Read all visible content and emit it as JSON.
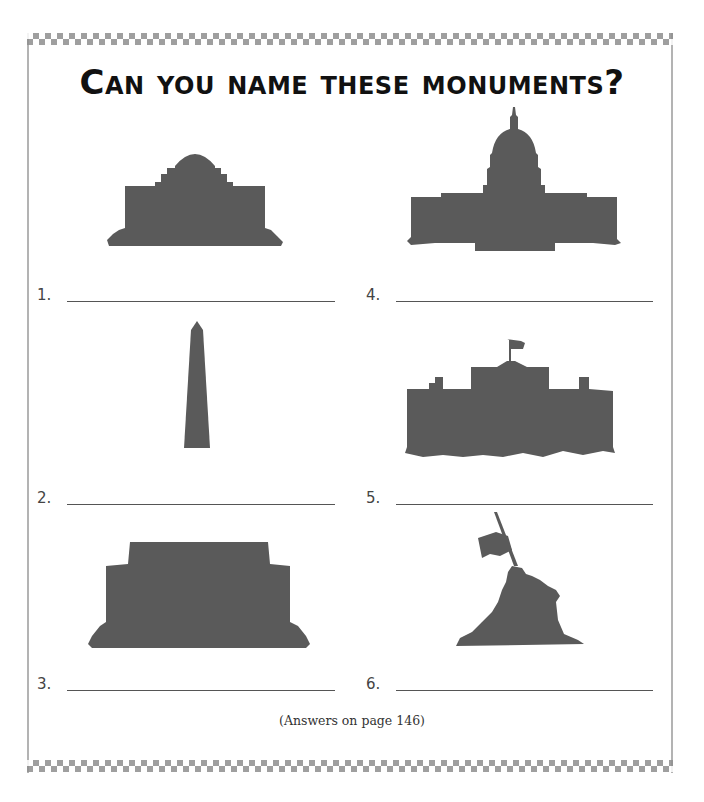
{
  "page": {
    "title": "Can you name these monuments?",
    "footer_note": "(Answers on page 146)",
    "colors": {
      "silhouette": "#5a5a5a",
      "border": "#8f8f8f",
      "text": "#111111"
    }
  },
  "monuments": [
    {
      "number": "1.",
      "silhouette": "domed-memorial-silhouette",
      "answer": ""
    },
    {
      "number": "2.",
      "silhouette": "obelisk-silhouette",
      "answer": ""
    },
    {
      "number": "3.",
      "silhouette": "columned-memorial-silhouette",
      "answer": ""
    },
    {
      "number": "4.",
      "silhouette": "capitol-dome-silhouette",
      "answer": ""
    },
    {
      "number": "5.",
      "silhouette": "flagged-mansion-silhouette",
      "answer": ""
    },
    {
      "number": "6.",
      "silhouette": "flag-raising-statue-silhouette",
      "answer": ""
    }
  ]
}
